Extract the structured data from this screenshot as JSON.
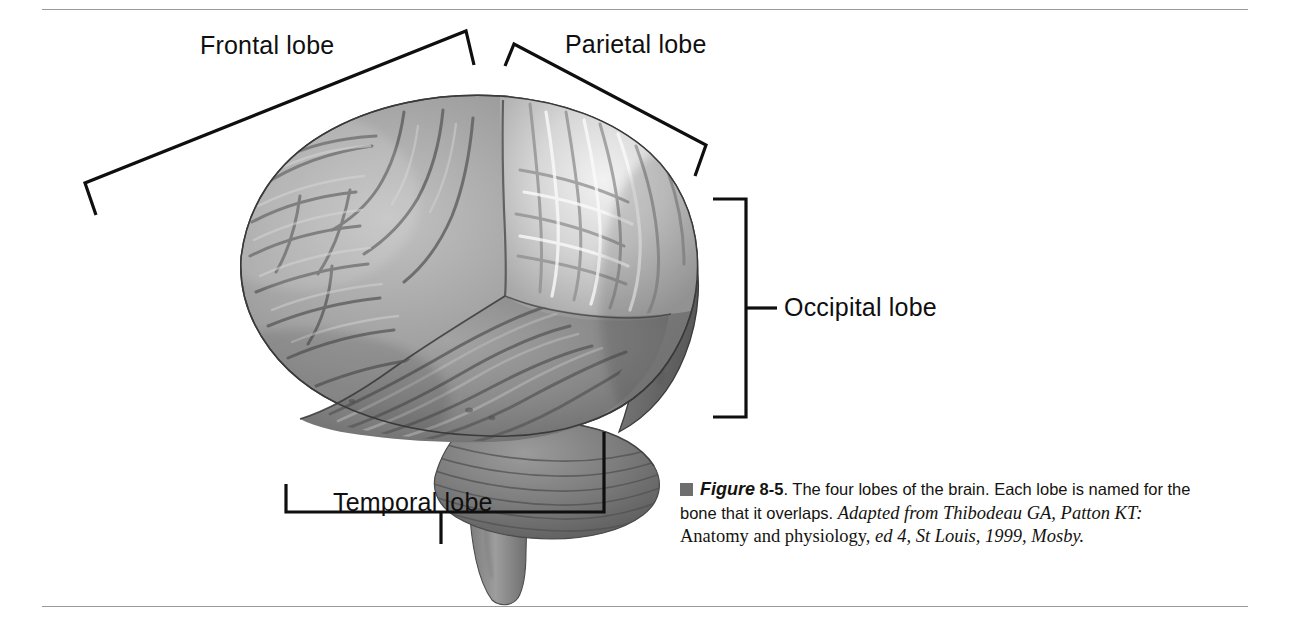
{
  "figure": {
    "number": "8-5",
    "figure_word": "Figure",
    "bullet_icon": "square-bullet-icon",
    "caption_sentence_1": "The four lobes of the brain. Each lobe is named for the bone that it overlaps.",
    "credit_source_italic": "Adapted from Thibodeau GA, Patton KT:",
    "credit_title": "Anatomy and physiology,",
    "credit_edition_italic": "ed 4, St Louis, 1999,",
    "credit_publisher_italic": "Mosby."
  },
  "labels": {
    "frontal": "Frontal lobe",
    "parietal": "Parietal lobe",
    "occipital": "Occipital lobe",
    "temporal": "Temporal lobe"
  },
  "illustration": {
    "subject": "lateral view of human brain",
    "regions": [
      {
        "name": "frontal-lobe",
        "tone": "#9a9a9a"
      },
      {
        "name": "parietal-lobe",
        "tone": "#dedede"
      },
      {
        "name": "temporal-lobe",
        "tone": "#8b8b8b"
      },
      {
        "name": "occipital-lobe",
        "tone": "#6f6f6f"
      },
      {
        "name": "cerebellum",
        "tone": "#7d7d7d"
      },
      {
        "name": "brainstem",
        "tone": "#888888"
      }
    ]
  },
  "colors": {
    "ink": "#100f0f",
    "rule": "#9a9a9a",
    "bullet": "#6e6e6e",
    "page_background": "#ffffff"
  }
}
